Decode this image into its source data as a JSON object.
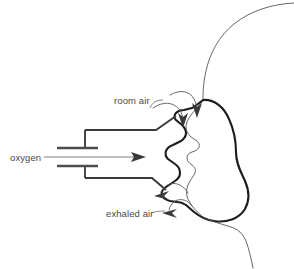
{
  "diagram": {
    "background_color": "#ffffff",
    "stroke_color": "#1c1c1c",
    "text_color": "#4a4a4a",
    "labels": {
      "oxygen": "oxygen",
      "room_air": "room air",
      "exhaled_air": "exhaled air"
    },
    "parts": {
      "mask": "oxygen face mask",
      "face": "patient facial profile",
      "tube": "oxygen supply tubing",
      "connector": "tube connector"
    },
    "flows": [
      {
        "name": "oxygen",
        "direction": "right",
        "arrow_count": 1
      },
      {
        "name": "room air",
        "direction": "into-mask",
        "arrow_count": 2
      },
      {
        "name": "exhaled air",
        "direction": "out-of-mask-left",
        "arrow_count": 2
      }
    ]
  }
}
